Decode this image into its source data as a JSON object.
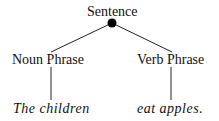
{
  "diagram": {
    "type": "parse-tree",
    "root": {
      "label": "Sentence"
    },
    "phrases": [
      {
        "label": "Noun Phrase",
        "words": "The children"
      },
      {
        "label": "Verb Phrase",
        "words": "eat apples."
      }
    ]
  }
}
